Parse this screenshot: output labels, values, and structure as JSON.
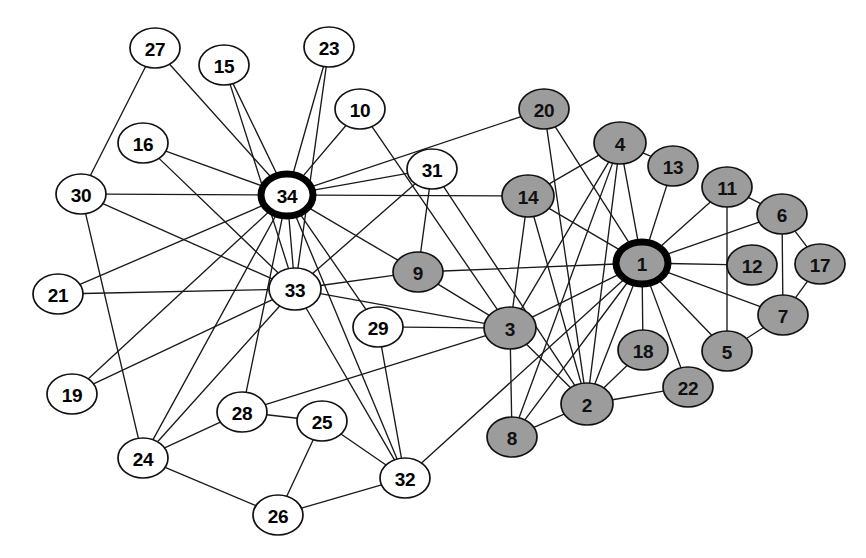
{
  "figure": {
    "title": "",
    "background_color": "#ffffff",
    "width": 866,
    "height": 558
  },
  "style": {
    "faction_a_color": "#9c9c9c",
    "faction_b_color": "#ffffff",
    "node_stroke_color": "#111111",
    "leader_ring_color": "#000000",
    "edge_color": "#1a1a1a",
    "label_color": "#000000"
  },
  "chart_data": {
    "type": "node-link-diagram",
    "title": "",
    "xlabel": "",
    "ylabel": "",
    "grid": false,
    "legend": [],
    "directed": false,
    "node_count": 34,
    "edge_count": 78,
    "groups": [
      {
        "id": "faction-a",
        "label": "",
        "color": "#9c9c9c"
      },
      {
        "id": "faction-b",
        "label": "",
        "color": "#ffffff"
      }
    ],
    "nodes": [
      {
        "id": 1,
        "label": "1",
        "x": 642,
        "y": 263,
        "rx": 26,
        "ry": 21,
        "group": "faction-a",
        "leader": true
      },
      {
        "id": 2,
        "label": "2",
        "x": 587,
        "y": 404,
        "rx": 26,
        "ry": 21,
        "group": "faction-a",
        "leader": false
      },
      {
        "id": 3,
        "label": "3",
        "x": 510,
        "y": 328,
        "rx": 26,
        "ry": 21,
        "group": "faction-a",
        "leader": false
      },
      {
        "id": 4,
        "label": "4",
        "x": 620,
        "y": 143,
        "rx": 26,
        "ry": 21,
        "group": "faction-a",
        "leader": false
      },
      {
        "id": 5,
        "label": "5",
        "x": 727,
        "y": 351,
        "rx": 25,
        "ry": 20,
        "group": "faction-a",
        "leader": false
      },
      {
        "id": 6,
        "label": "6",
        "x": 782,
        "y": 214,
        "rx": 25,
        "ry": 20,
        "group": "faction-a",
        "leader": false
      },
      {
        "id": 7,
        "label": "7",
        "x": 783,
        "y": 315,
        "rx": 25,
        "ry": 20,
        "group": "faction-a",
        "leader": false
      },
      {
        "id": 8,
        "label": "8",
        "x": 512,
        "y": 437,
        "rx": 25,
        "ry": 20,
        "group": "faction-a",
        "leader": false
      },
      {
        "id": 9,
        "label": "9",
        "x": 418,
        "y": 272,
        "rx": 25,
        "ry": 20,
        "group": "faction-a",
        "leader": false
      },
      {
        "id": 10,
        "label": "10",
        "x": 360,
        "y": 109,
        "rx": 25,
        "ry": 20,
        "group": "faction-b",
        "leader": false
      },
      {
        "id": 11,
        "label": "11",
        "x": 727,
        "y": 187,
        "rx": 25,
        "ry": 20,
        "group": "faction-a",
        "leader": false
      },
      {
        "id": 12,
        "label": "12",
        "x": 752,
        "y": 265,
        "rx": 25,
        "ry": 20,
        "group": "faction-a",
        "leader": false
      },
      {
        "id": 13,
        "label": "13",
        "x": 673,
        "y": 166,
        "rx": 25,
        "ry": 20,
        "group": "faction-a",
        "leader": false
      },
      {
        "id": 14,
        "label": "14",
        "x": 528,
        "y": 196,
        "rx": 26,
        "ry": 21,
        "group": "faction-a",
        "leader": false
      },
      {
        "id": 15,
        "label": "15",
        "x": 224,
        "y": 65,
        "rx": 25,
        "ry": 20,
        "group": "faction-b",
        "leader": false
      },
      {
        "id": 16,
        "label": "16",
        "x": 143,
        "y": 143,
        "rx": 25,
        "ry": 20,
        "group": "faction-b",
        "leader": false
      },
      {
        "id": 17,
        "label": "17",
        "x": 820,
        "y": 264,
        "rx": 25,
        "ry": 20,
        "group": "faction-a",
        "leader": false
      },
      {
        "id": 18,
        "label": "18",
        "x": 643,
        "y": 350,
        "rx": 25,
        "ry": 20,
        "group": "faction-a",
        "leader": false
      },
      {
        "id": 19,
        "label": "19",
        "x": 72,
        "y": 394,
        "rx": 25,
        "ry": 20,
        "group": "faction-b",
        "leader": false
      },
      {
        "id": 20,
        "label": "20",
        "x": 544,
        "y": 109,
        "rx": 25,
        "ry": 20,
        "group": "faction-a",
        "leader": false
      },
      {
        "id": 21,
        "label": "21",
        "x": 58,
        "y": 294,
        "rx": 25,
        "ry": 20,
        "group": "faction-b",
        "leader": false
      },
      {
        "id": 22,
        "label": "22",
        "x": 688,
        "y": 387,
        "rx": 25,
        "ry": 20,
        "group": "faction-a",
        "leader": false
      },
      {
        "id": 23,
        "label": "23",
        "x": 329,
        "y": 47,
        "rx": 25,
        "ry": 20,
        "group": "faction-b",
        "leader": false
      },
      {
        "id": 24,
        "label": "24",
        "x": 143,
        "y": 458,
        "rx": 25,
        "ry": 20,
        "group": "faction-b",
        "leader": false
      },
      {
        "id": 25,
        "label": "25",
        "x": 322,
        "y": 421,
        "rx": 25,
        "ry": 20,
        "group": "faction-b",
        "leader": false
      },
      {
        "id": 26,
        "label": "26",
        "x": 278,
        "y": 515,
        "rx": 25,
        "ry": 20,
        "group": "faction-b",
        "leader": false
      },
      {
        "id": 27,
        "label": "27",
        "x": 155,
        "y": 48,
        "rx": 25,
        "ry": 20,
        "group": "faction-b",
        "leader": false
      },
      {
        "id": 28,
        "label": "28",
        "x": 242,
        "y": 412,
        "rx": 25,
        "ry": 20,
        "group": "faction-b",
        "leader": false
      },
      {
        "id": 29,
        "label": "29",
        "x": 378,
        "y": 327,
        "rx": 25,
        "ry": 20,
        "group": "faction-b",
        "leader": false
      },
      {
        "id": 30,
        "label": "30",
        "x": 81,
        "y": 194,
        "rx": 25,
        "ry": 20,
        "group": "faction-b",
        "leader": false
      },
      {
        "id": 31,
        "label": "31",
        "x": 432,
        "y": 169,
        "rx": 25,
        "ry": 20,
        "group": "faction-b",
        "leader": false
      },
      {
        "id": 32,
        "label": "32",
        "x": 405,
        "y": 478,
        "rx": 25,
        "ry": 20,
        "group": "faction-b",
        "leader": false
      },
      {
        "id": 33,
        "label": "33",
        "x": 295,
        "y": 289,
        "rx": 26,
        "ry": 21,
        "group": "faction-b",
        "leader": false
      },
      {
        "id": 34,
        "label": "34",
        "x": 287,
        "y": 195,
        "rx": 26,
        "ry": 21,
        "group": "faction-b",
        "leader": true
      }
    ],
    "edges": [
      [
        2,
        1
      ],
      [
        3,
        1
      ],
      [
        3,
        2
      ],
      [
        4,
        1
      ],
      [
        4,
        2
      ],
      [
        4,
        3
      ],
      [
        5,
        1
      ],
      [
        6,
        1
      ],
      [
        7,
        1
      ],
      [
        7,
        5
      ],
      [
        7,
        6
      ],
      [
        8,
        1
      ],
      [
        8,
        2
      ],
      [
        8,
        3
      ],
      [
        8,
        4
      ],
      [
        9,
        1
      ],
      [
        9,
        3
      ],
      [
        10,
        3
      ],
      [
        11,
        1
      ],
      [
        11,
        5
      ],
      [
        11,
        6
      ],
      [
        12,
        1
      ],
      [
        13,
        1
      ],
      [
        13,
        4
      ],
      [
        14,
        1
      ],
      [
        14,
        2
      ],
      [
        14,
        3
      ],
      [
        14,
        4
      ],
      [
        17,
        6
      ],
      [
        17,
        7
      ],
      [
        18,
        1
      ],
      [
        18,
        2
      ],
      [
        20,
        1
      ],
      [
        20,
        2
      ],
      [
        22,
        1
      ],
      [
        22,
        2
      ],
      [
        26,
        24
      ],
      [
        26,
        25
      ],
      [
        28,
        3
      ],
      [
        28,
        24
      ],
      [
        28,
        25
      ],
      [
        29,
        3
      ],
      [
        30,
        24
      ],
      [
        30,
        27
      ],
      [
        31,
        2
      ],
      [
        31,
        9
      ],
      [
        32,
        1
      ],
      [
        32,
        25
      ],
      [
        32,
        26
      ],
      [
        32,
        29
      ],
      [
        33,
        3
      ],
      [
        33,
        9
      ],
      [
        33,
        15
      ],
      [
        33,
        16
      ],
      [
        33,
        19
      ],
      [
        33,
        21
      ],
      [
        33,
        23
      ],
      [
        33,
        24
      ],
      [
        33,
        30
      ],
      [
        33,
        31
      ],
      [
        33,
        32
      ],
      [
        34,
        9
      ],
      [
        34,
        10
      ],
      [
        34,
        14
      ],
      [
        34,
        15
      ],
      [
        34,
        16
      ],
      [
        34,
        19
      ],
      [
        34,
        20
      ],
      [
        34,
        21
      ],
      [
        34,
        23
      ],
      [
        34,
        24
      ],
      [
        34,
        27
      ],
      [
        34,
        28
      ],
      [
        34,
        29
      ],
      [
        34,
        30
      ],
      [
        34,
        31
      ],
      [
        34,
        32
      ],
      [
        34,
        33
      ]
    ]
  }
}
